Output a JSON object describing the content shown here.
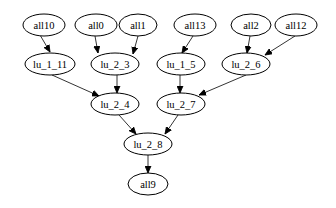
{
  "diagram": {
    "type": "directed-graph",
    "nodes": [
      {
        "id": "all10",
        "label": "all10"
      },
      {
        "id": "all0",
        "label": "all0"
      },
      {
        "id": "all1",
        "label": "all1"
      },
      {
        "id": "all13",
        "label": "all13"
      },
      {
        "id": "all2",
        "label": "all2"
      },
      {
        "id": "all12",
        "label": "all12"
      },
      {
        "id": "lu_1_11",
        "label": "lu_1_11"
      },
      {
        "id": "lu_2_3",
        "label": "lu_2_3"
      },
      {
        "id": "lu_1_5",
        "label": "lu_1_5"
      },
      {
        "id": "lu_2_6",
        "label": "lu_2_6"
      },
      {
        "id": "lu_2_4",
        "label": "lu_2_4"
      },
      {
        "id": "lu_2_7",
        "label": "lu_2_7"
      },
      {
        "id": "lu_2_8",
        "label": "lu_2_8"
      },
      {
        "id": "all9",
        "label": "all9"
      }
    ],
    "edges": [
      {
        "from": "all10",
        "to": "lu_1_11"
      },
      {
        "from": "all0",
        "to": "lu_2_3"
      },
      {
        "from": "all1",
        "to": "lu_2_3"
      },
      {
        "from": "all13",
        "to": "lu_1_5"
      },
      {
        "from": "all2",
        "to": "lu_2_6"
      },
      {
        "from": "all12",
        "to": "lu_2_6"
      },
      {
        "from": "lu_1_11",
        "to": "lu_2_4"
      },
      {
        "from": "lu_2_3",
        "to": "lu_2_4"
      },
      {
        "from": "lu_1_5",
        "to": "lu_2_7"
      },
      {
        "from": "lu_2_6",
        "to": "lu_2_7"
      },
      {
        "from": "lu_2_4",
        "to": "lu_2_8"
      },
      {
        "from": "lu_2_7",
        "to": "lu_2_8"
      },
      {
        "from": "lu_2_8",
        "to": "all9"
      }
    ]
  }
}
